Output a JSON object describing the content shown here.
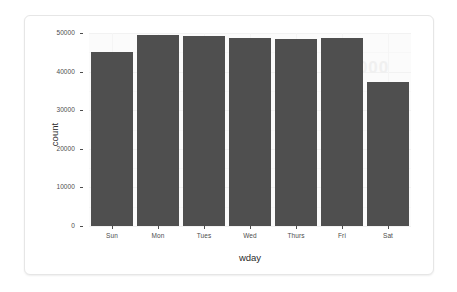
{
  "chart_data": {
    "type": "bar",
    "title": "",
    "subtitle": "",
    "xlabel": "wday",
    "ylabel": "count",
    "categories": [
      "Sun",
      "Mon",
      "Tues",
      "Wed",
      "Thurs",
      "Fri",
      "Sat"
    ],
    "values": [
      45000,
      49500,
      49200,
      48700,
      48500,
      48700,
      37200
    ],
    "ylim": [
      0,
      50000
    ],
    "ytick_values": [
      0,
      10000,
      20000,
      30000,
      40000,
      50000
    ],
    "ytick_labels": [
      "0",
      "10000",
      "20000",
      "30000",
      "40000",
      "50000"
    ],
    "grid": true,
    "legend": "none",
    "bar_color": "#4f4f4f",
    "panel_background": "#fbfbfb",
    "gridline_color": "#f2f2f2"
  },
  "card": {
    "background": "#ffffff",
    "border_color": "#e6e6e6"
  },
  "watermark": {
    "text": "51000"
  }
}
